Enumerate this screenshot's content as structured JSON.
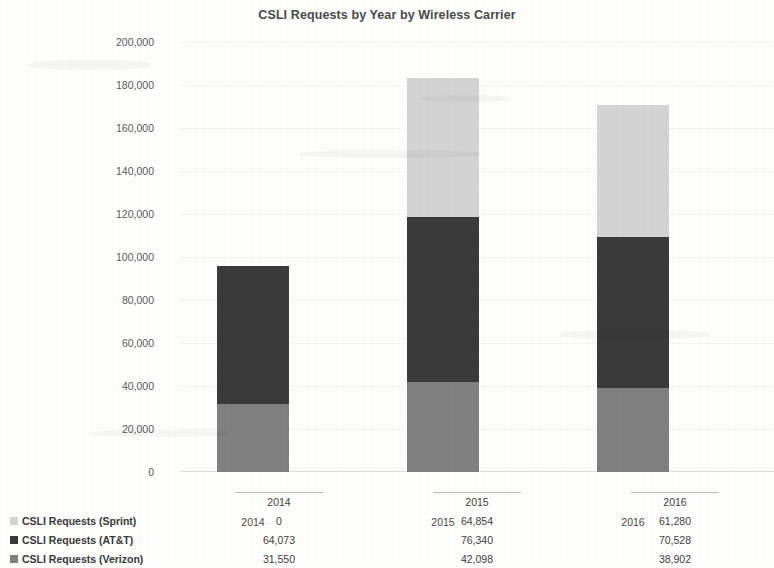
{
  "chart_data": {
    "type": "bar",
    "subtype": "stacked-column",
    "title": "CSLI Requests by Year by Wireless Carrier",
    "xlabel": "",
    "ylabel": "",
    "categories": [
      "2014",
      "2015",
      "2016"
    ],
    "ylim": [
      0,
      200000
    ],
    "ytick_labels": [
      "200,000",
      "180,000",
      "160,000",
      "140,000",
      "120,000",
      "100,000",
      "80,000",
      "60,000",
      "40,000",
      "20,000",
      "0"
    ],
    "ytick_values": [
      200000,
      180000,
      160000,
      140000,
      120000,
      100000,
      80000,
      60000,
      40000,
      20000,
      0
    ],
    "grid": false,
    "legend_position": "bottom-table",
    "stack_order_bottom_to_top": [
      "CSLI Requests (Verizon)",
      "CSLI Requests (AT&T)",
      "CSLI Requests (Sprint)"
    ],
    "series": [
      {
        "name": "CSLI Requests (Sprint)",
        "color": "#d3d3d3",
        "values": [
          0,
          64854,
          61280
        ],
        "labels": [
          "0",
          "64,854",
          "61,280"
        ]
      },
      {
        "name": "CSLI Requests (AT&T)",
        "color": "#3a3a3a",
        "values": [
          64073,
          76340,
          70528
        ],
        "labels": [
          "64,073",
          "76,340",
          "70,528"
        ]
      },
      {
        "name": "CSLI Requests (Verizon)",
        "color": "#808080",
        "values": [
          31550,
          42098,
          38902
        ],
        "labels": [
          "31,550",
          "42,098",
          "38,902"
        ]
      }
    ],
    "totals": [
      95623,
      183292,
      170710
    ]
  },
  "colors": {
    "sprint": "#d3d3d3",
    "att": "#3a3a3a",
    "verizon": "#808080",
    "text": "#3b3b3b",
    "page_background": "#fdfdfc"
  }
}
